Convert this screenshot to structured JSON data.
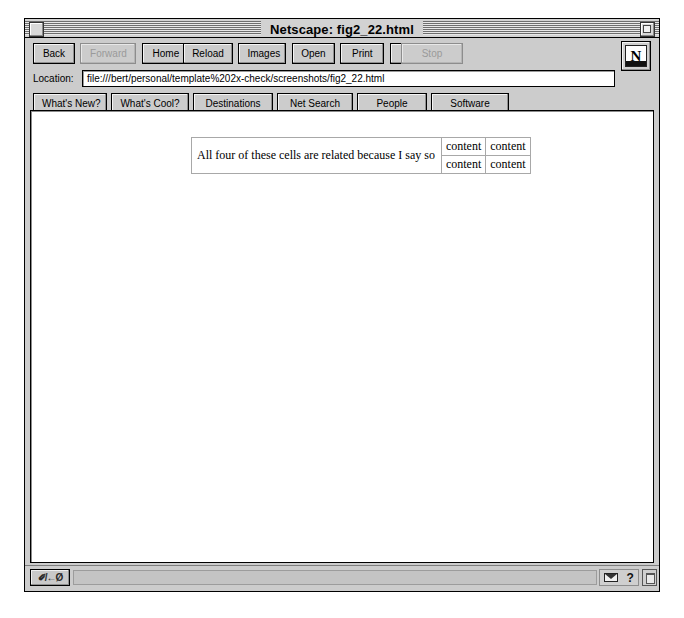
{
  "window": {
    "title": "Netscape: fig2_22.html",
    "close_box": "close-box",
    "zoom_box": "zoom-box"
  },
  "toolbar": {
    "buttons": [
      {
        "label": "Back",
        "disabled": false
      },
      {
        "label": "Forward",
        "disabled": true
      },
      {
        "label": "Home",
        "disabled": false
      },
      {
        "label": "Reload",
        "disabled": false
      },
      {
        "label": "Images",
        "disabled": false
      },
      {
        "label": "Open",
        "disabled": false
      },
      {
        "label": "Print",
        "disabled": false
      },
      {
        "label": "Find",
        "disabled": false
      },
      {
        "label": "Stop",
        "disabled": true
      }
    ],
    "logo_letter": "N"
  },
  "location": {
    "label": "Location:",
    "value": "file:///bert/personal/template%202x-check/screenshots/fig2_22.html",
    "placeholder": ""
  },
  "directory": {
    "buttons": [
      "What's New?",
      "What's Cool?",
      "Destinations",
      "Net Search",
      "People",
      "Software"
    ]
  },
  "page": {
    "table": {
      "spanning_cell": "All four of these cells are related because I say so",
      "rows": [
        [
          "content",
          "content"
        ],
        [
          "content",
          "content"
        ]
      ]
    }
  },
  "statusbar": {
    "security_label": "✐/←Ø",
    "status_text": "",
    "mail_icon": "mail-icon",
    "help_icon": "?",
    "resize_grip": "resize-grip"
  },
  "colors": {
    "chrome": "#cccccc",
    "titlebar": "#d2d2d2",
    "canvas": "#ffffff",
    "border": "#000000",
    "disabled_text": "#9a9a9a",
    "table_border": "#a8a8a8"
  }
}
